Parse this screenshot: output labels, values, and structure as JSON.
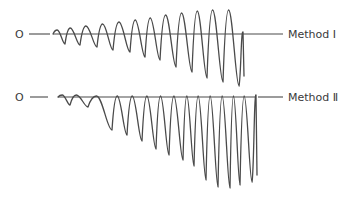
{
  "figure": {
    "traces": [
      {
        "id": "method-1",
        "origin_label": "O",
        "label": "Method Ⅰ",
        "baseline_y": 34,
        "lead_line": [
          29,
          50
        ],
        "tail_line": [
          243,
          283
        ],
        "troughs": [
          {
            "x": 65,
            "y": 44,
            "peak_y": 30
          },
          {
            "x": 80,
            "y": 45,
            "peak_y": 28
          },
          {
            "x": 97,
            "y": 47,
            "peak_y": 26
          },
          {
            "x": 113,
            "y": 50,
            "peak_y": 24
          },
          {
            "x": 130,
            "y": 52,
            "peak_y": 22
          },
          {
            "x": 145,
            "y": 57,
            "peak_y": 20
          },
          {
            "x": 160,
            "y": 60,
            "peak_y": 18
          },
          {
            "x": 176,
            "y": 67,
            "peak_y": 15
          },
          {
            "x": 192,
            "y": 72,
            "peak_y": 13
          },
          {
            "x": 207,
            "y": 78,
            "peak_y": 11
          },
          {
            "x": 223,
            "y": 82,
            "peak_y": 10
          },
          {
            "x": 239,
            "y": 86,
            "peak_y": 10
          }
        ],
        "end_stub": {
          "x": 244,
          "y_top": 40,
          "y_bottom": 76
        }
      },
      {
        "id": "method-2",
        "origin_label": "O",
        "label": "Method Ⅱ",
        "baseline_y": 97,
        "lead_line": [
          30,
          48
        ],
        "tail_line": [
          258,
          283
        ],
        "troughs": [
          {
            "x": 70,
            "y": 105,
            "peak_y": 95
          },
          {
            "x": 88,
            "y": 107,
            "peak_y": 95
          },
          {
            "x": 112,
            "y": 130,
            "peak_y": 96
          },
          {
            "x": 127,
            "y": 135,
            "peak_y": 96
          },
          {
            "x": 142,
            "y": 141,
            "peak_y": 96
          },
          {
            "x": 156,
            "y": 149,
            "peak_y": 96
          },
          {
            "x": 169,
            "y": 155,
            "peak_y": 96
          },
          {
            "x": 183,
            "y": 160,
            "peak_y": 96
          },
          {
            "x": 194,
            "y": 166,
            "peak_y": 96
          },
          {
            "x": 206,
            "y": 180,
            "peak_y": 96
          },
          {
            "x": 218,
            "y": 187,
            "peak_y": 96
          },
          {
            "x": 230,
            "y": 188,
            "peak_y": 96
          },
          {
            "x": 240,
            "y": 185,
            "peak_y": 96
          },
          {
            "x": 252,
            "y": 182,
            "peak_y": 96
          }
        ],
        "end_stub": {
          "x": 257,
          "y_top": 111,
          "y_bottom": 175
        }
      }
    ]
  }
}
